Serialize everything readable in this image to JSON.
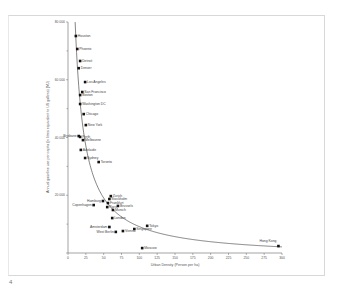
{
  "page_number": "4",
  "chart_data": {
    "type": "scatter",
    "title": "",
    "xlabel": "Urban Density (Person per ha)",
    "ylabel": "Annual gasoline use per capita (in litres equivalent to US gallons) (MJ)",
    "xlim": [
      0,
      300
    ],
    "ylim": [
      0,
      80000
    ],
    "x_ticks": [
      "0",
      "25",
      "50",
      "75",
      "100",
      "125",
      "150",
      "175",
      "200",
      "225",
      "250",
      "275",
      "300"
    ],
    "y_ticks": [
      "0",
      "20 000",
      "40 000",
      "60 000",
      "80 000"
    ],
    "grid": false,
    "legend": null,
    "trend_line": "hyperbolic fit (decreasing curve)",
    "points": [
      {
        "city": "Houston",
        "x": 11,
        "y": 75150
      },
      {
        "city": "Phoenix",
        "x": 13,
        "y": 70650
      },
      {
        "city": "Detroit",
        "x": 17,
        "y": 66500
      },
      {
        "city": "Denver",
        "x": 15,
        "y": 64000
      },
      {
        "city": "Los Angeles",
        "x": 24,
        "y": 59200
      },
      {
        "city": "San Francisco",
        "x": 20,
        "y": 55750
      },
      {
        "city": "Boston",
        "x": 17,
        "y": 54700
      },
      {
        "city": "Washington DC",
        "x": 17,
        "y": 51600
      },
      {
        "city": "Chicago",
        "x": 22,
        "y": 48100
      },
      {
        "city": "New York",
        "x": 25,
        "y": 44300
      },
      {
        "city": "Brisbane",
        "x": 15,
        "y": 40500
      },
      {
        "city": "Perth",
        "x": 17,
        "y": 40200
      },
      {
        "city": "Melbourne",
        "x": 21,
        "y": 39100
      },
      {
        "city": "Adelaide",
        "x": 18,
        "y": 35700
      },
      {
        "city": "Sydney",
        "x": 24,
        "y": 32900
      },
      {
        "city": "Toronto",
        "x": 43,
        "y": 31500
      },
      {
        "city": "Zurich",
        "x": 60,
        "y": 19700
      },
      {
        "city": "Stockholm",
        "x": 58,
        "y": 18700
      },
      {
        "city": "Hamburg",
        "x": 49,
        "y": 18000
      },
      {
        "city": "Frankfurt",
        "x": 56,
        "y": 17300
      },
      {
        "city": "Copenhagen",
        "x": 36,
        "y": 16600
      },
      {
        "city": "Brussels",
        "x": 70,
        "y": 16300
      },
      {
        "city": "Paris",
        "x": 55,
        "y": 15900
      },
      {
        "city": "Munich",
        "x": 63,
        "y": 14900
      },
      {
        "city": "London",
        "x": 62,
        "y": 12100
      },
      {
        "city": "Tokyo",
        "x": 111,
        "y": 9400
      },
      {
        "city": "Amsterdam",
        "x": 58,
        "y": 9000
      },
      {
        "city": "Singapore",
        "x": 93,
        "y": 8300
      },
      {
        "city": "Vienna",
        "x": 77,
        "y": 7600
      },
      {
        "city": "West Berlin",
        "x": 67,
        "y": 7300
      },
      {
        "city": "Hong Kong",
        "x": 295,
        "y": 2400
      },
      {
        "city": "Moscow",
        "x": 104,
        "y": 1700
      }
    ]
  }
}
